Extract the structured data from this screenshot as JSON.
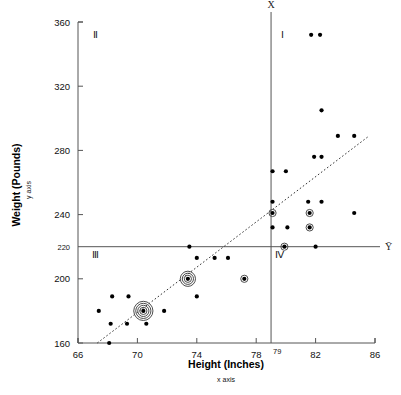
{
  "chart_data": {
    "type": "scatter",
    "title": "",
    "xlabel": "Height (Inches)",
    "xsublabel": "x axis",
    "ylabel": "Weight (Pounds)",
    "ysublabel": "y axis",
    "xlim": [
      66,
      86
    ],
    "ylim": [
      160,
      360
    ],
    "xticks": [
      66,
      70,
      74,
      78,
      82,
      86
    ],
    "yticks": [
      360,
      320,
      280,
      240,
      220,
      200,
      160
    ],
    "x_mean": 79,
    "y_mean": 220,
    "x_mean_label": "X̄",
    "y_mean_label": "Ȳ",
    "x_mean_tick_label": "79",
    "grid": false,
    "legend": null,
    "quadrants": [
      {
        "id": "I",
        "label": "Ⅰ",
        "x": 79.8,
        "y": 350
      },
      {
        "id": "II",
        "label": "Ⅱ",
        "x": 67.2,
        "y": 350
      },
      {
        "id": "III",
        "label": "Ⅲ",
        "x": 67.2,
        "y": 213
      },
      {
        "id": "IV",
        "label": "Ⅳ",
        "x": 79.6,
        "y": 213
      }
    ],
    "trend_line": {
      "x1": 67.3,
      "y1": 160,
      "x2": 85.6,
      "y2": 289,
      "style": "dotted"
    },
    "points": [
      {
        "x": 81.7,
        "y": 352,
        "rings": 0
      },
      {
        "x": 82.3,
        "y": 352,
        "rings": 0
      },
      {
        "x": 82.4,
        "y": 305,
        "rings": 0
      },
      {
        "x": 83.5,
        "y": 289,
        "rings": 0
      },
      {
        "x": 84.6,
        "y": 289,
        "rings": 0
      },
      {
        "x": 81.9,
        "y": 276,
        "rings": 0
      },
      {
        "x": 82.4,
        "y": 276,
        "rings": 0
      },
      {
        "x": 79.1,
        "y": 267,
        "rings": 0
      },
      {
        "x": 80.0,
        "y": 267,
        "rings": 0
      },
      {
        "x": 79.1,
        "y": 248,
        "rings": 0
      },
      {
        "x": 81.5,
        "y": 248,
        "rings": 0
      },
      {
        "x": 82.4,
        "y": 248,
        "rings": 0
      },
      {
        "x": 79.1,
        "y": 241,
        "rings": 1
      },
      {
        "x": 81.6,
        "y": 241,
        "rings": 1
      },
      {
        "x": 84.6,
        "y": 241,
        "rings": 0
      },
      {
        "x": 79.1,
        "y": 232,
        "rings": 0
      },
      {
        "x": 80.1,
        "y": 232,
        "rings": 0
      },
      {
        "x": 81.6,
        "y": 232,
        "rings": 1
      },
      {
        "x": 79.9,
        "y": 220,
        "rings": 1
      },
      {
        "x": 82.0,
        "y": 220,
        "rings": 0
      },
      {
        "x": 73.5,
        "y": 220,
        "rings": 0
      },
      {
        "x": 74.0,
        "y": 213,
        "rings": 0
      },
      {
        "x": 75.2,
        "y": 213,
        "rings": 0
      },
      {
        "x": 76.1,
        "y": 213,
        "rings": 0
      },
      {
        "x": 73.4,
        "y": 200,
        "rings": 3
      },
      {
        "x": 77.2,
        "y": 200,
        "rings": 1
      },
      {
        "x": 68.3,
        "y": 189,
        "rings": 0
      },
      {
        "x": 69.4,
        "y": 189,
        "rings": 0
      },
      {
        "x": 74.0,
        "y": 189,
        "rings": 0
      },
      {
        "x": 67.4,
        "y": 180,
        "rings": 0
      },
      {
        "x": 70.4,
        "y": 180,
        "rings": 4
      },
      {
        "x": 71.8,
        "y": 180,
        "rings": 0
      },
      {
        "x": 68.2,
        "y": 172,
        "rings": 0
      },
      {
        "x": 69.3,
        "y": 172,
        "rings": 0
      },
      {
        "x": 70.6,
        "y": 172,
        "rings": 0
      },
      {
        "x": 68.1,
        "y": 160,
        "rings": 0
      }
    ]
  }
}
